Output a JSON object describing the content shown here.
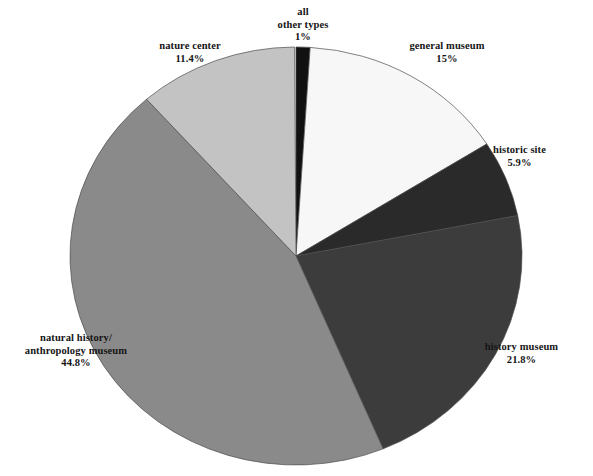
{
  "figure": {
    "cropped_title_fragment": "organization type",
    "background_color": "#ffffff"
  },
  "chart_data": {
    "type": "pie",
    "title": "",
    "xlabel": "",
    "ylabel": "",
    "units": "percent",
    "start_angle_deg": 0,
    "direction": "clockwise",
    "legend_position": "outside-labels",
    "grid": false,
    "center": {
      "cx": 296,
      "cy": 256,
      "rx": 226,
      "ry": 209
    },
    "categories": [
      "all other types",
      "general museum",
      "historic site",
      "history museum",
      "natural history/ anthropology museum",
      "nature center"
    ],
    "values": [
      1,
      15,
      5.9,
      21.8,
      44.8,
      11.4
    ],
    "colors": [
      "#111111",
      "#f7f7f7",
      "#2a2a2a",
      "#3c3c3c",
      "#8a8a8a",
      "#c3c3c3"
    ],
    "slices": [
      {
        "name": "all other types",
        "label_line1": "all",
        "label_line2": "other types",
        "value": 1,
        "value_label": "1%",
        "color": "#111111",
        "start_deg": 0,
        "end_deg": 3.6
      },
      {
        "name": "general museum",
        "label_line1": "general museum",
        "label_line2": "",
        "value": 15,
        "value_label": "15%",
        "color": "#f7f7f7",
        "start_deg": 3.6,
        "end_deg": 57.6
      },
      {
        "name": "historic site",
        "label_line1": "historic site",
        "label_line2": "",
        "value": 5.9,
        "value_label": "5.9%",
        "color": "#2a2a2a",
        "start_deg": 57.6,
        "end_deg": 78.84
      },
      {
        "name": "history museum",
        "label_line1": "history museum",
        "label_line2": "",
        "value": 21.8,
        "value_label": "21.8%",
        "color": "#3c3c3c",
        "start_deg": 78.84,
        "end_deg": 157.32
      },
      {
        "name": "natural history/ anthropology museum",
        "label_line1": "natural history/",
        "label_line2": "anthropology museum",
        "value": 44.8,
        "value_label": "44.8%",
        "color": "#8a8a8a",
        "start_deg": 157.32,
        "end_deg": 318.6
      },
      {
        "name": "nature center",
        "label_line1": "nature center",
        "label_line2": "",
        "value": 11.4,
        "value_label": "11.4%",
        "color": "#c3c3c3",
        "start_deg": 318.6,
        "end_deg": 359.64
      }
    ]
  }
}
